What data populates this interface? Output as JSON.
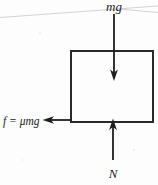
{
  "figure": {
    "kind": "free-body-diagram",
    "caption": "",
    "background_color": "#fdfdfd",
    "ink_color": "#1f1f1f",
    "canvas": {
      "width": 158,
      "height": 185
    }
  },
  "block": {
    "name": "block",
    "x": 71,
    "y": 51,
    "width": 82,
    "height": 71,
    "stroke_color": "#2a2a2a",
    "stroke_width": 2,
    "fill": "none"
  },
  "forces": [
    {
      "id": "weight",
      "label": "mg",
      "direction": "down",
      "label_x": 114,
      "label_y": 10,
      "line_x1": 114,
      "line_y1": 14,
      "line_x2": 114,
      "line_y2": 80,
      "head_at": "end",
      "description": "gravitational force acting downward through the center of the block"
    },
    {
      "id": "normal",
      "label": "N",
      "direction": "up",
      "label_x": 113,
      "label_y": 177,
      "line_x1": 113,
      "line_y1": 160,
      "line_x2": 113,
      "line_y2": 119,
      "head_at": "end",
      "description": "normal force acting upward on the bottom face of the block"
    },
    {
      "id": "friction",
      "label": "f = μmg",
      "direction": "left",
      "label_x": 3,
      "label_y": 125,
      "line_x1": 71,
      "line_y1": 120,
      "line_x2": 44,
      "line_y2": 120,
      "head_at": "end",
      "description": "friction force acting leftward along the bottom edge of the block"
    }
  ],
  "artifacts": {
    "scan_line_label": "scan-line-artifact",
    "scan_line": {
      "x1": 0,
      "y1": 17,
      "x2": 158,
      "y2": 6
    },
    "scan_line_2": {
      "x1": 118,
      "y1": 9,
      "x2": 158,
      "y2": 13
    }
  }
}
